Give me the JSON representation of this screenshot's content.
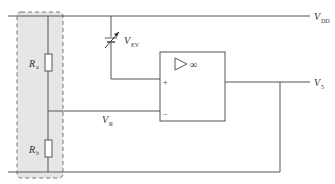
{
  "diagram": {
    "type": "circuit",
    "labels": {
      "vdd": {
        "main": "V",
        "sub": "DD"
      },
      "vev": {
        "main": "V",
        "sub": "EV"
      },
      "vr": {
        "main": "V",
        "sub": "R"
      },
      "v5": {
        "main": "V",
        "sub": "5"
      },
      "ra": {
        "main": "R",
        "sub": "a"
      },
      "rb": {
        "main": "R",
        "sub": "b"
      },
      "opamp_symbol": "∞",
      "plus": "+",
      "minus": "−"
    },
    "colors": {
      "wire": "#555555",
      "dashed_box_fill": "#e6e6e6",
      "dashed_box_stroke": "#777777"
    }
  }
}
